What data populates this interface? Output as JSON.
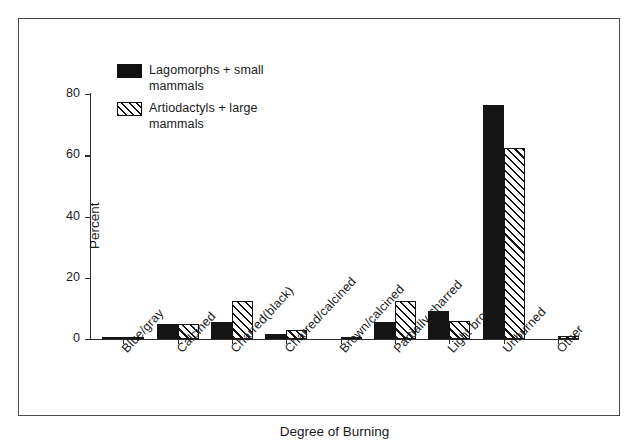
{
  "chart_data": {
    "type": "bar",
    "title": "",
    "xlabel": "Degree of Burning",
    "ylabel": "Percent",
    "ylim": [
      0,
      80
    ],
    "yticks": [
      0,
      20,
      40,
      60,
      80
    ],
    "ytick_labels": [
      "0",
      "20",
      "40",
      "60",
      "80"
    ],
    "grid": false,
    "legend_position": "upper-left-inside",
    "categories": [
      "Blue/gray",
      "Calcined",
      "Charred(black)",
      "Charred/calcined",
      "Brown/calcined",
      "Partially charred",
      "Light brown",
      "Unburned",
      "Other"
    ],
    "series": [
      {
        "name": "Lagomorphs + small mammals",
        "pattern": "solid-black",
        "values": [
          0.6,
          5.0,
          5.5,
          1.5,
          0.0,
          5.5,
          9.0,
          76.5,
          0.0
        ]
      },
      {
        "name": "Artiodactyls + large mammals",
        "pattern": "diagonal-hatch",
        "values": [
          0.8,
          5.0,
          12.5,
          3.0,
          0.3,
          12.5,
          6.0,
          62.5,
          1.0
        ]
      }
    ]
  },
  "legend": {
    "entries": [
      {
        "label": "Lagomorphs + small\nmammals",
        "swatch": "solid-black-swatch"
      },
      {
        "label": "Artiodactyls + large\nmammals",
        "swatch": "diagonal-hatch-swatch"
      }
    ]
  },
  "colors": {
    "series_solid": "#141414",
    "series_hatch_line": "#141414",
    "axis": "#2b2b2b",
    "frame": "#4a4a4a",
    "background": "#ffffff"
  }
}
